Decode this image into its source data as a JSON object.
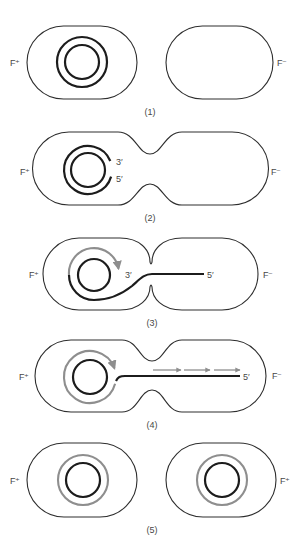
{
  "figure": {
    "colors": {
      "outline": "#2e2e2e",
      "strand": "#1c1c1c",
      "new_strand": "#8e8e8e",
      "label": "#474747"
    },
    "panels": [
      {
        "caption": "(1)",
        "left_label": "F⁺",
        "right_label": "F⁻"
      },
      {
        "caption": "(2)",
        "left_label": "F⁺",
        "right_label": "F⁻",
        "end_3_label": "3′",
        "end_5_label": "5′"
      },
      {
        "caption": "(3)",
        "left_label": "F⁺",
        "right_label": "F⁻",
        "end_3_label": "3′",
        "end_5_label": "5′"
      },
      {
        "caption": "(4)",
        "left_label": "F⁺",
        "right_label": "F⁻",
        "end_5_label": "5′"
      },
      {
        "caption": "(5)",
        "left_label": "F⁺",
        "right_label": "F⁺"
      }
    ]
  }
}
